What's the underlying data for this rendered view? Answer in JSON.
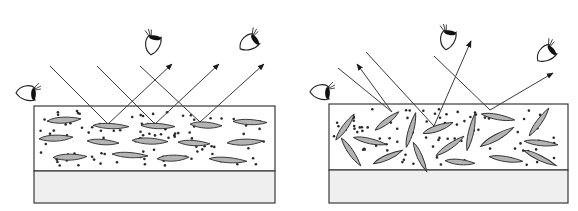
{
  "figure": {
    "colors": {
      "line": "#3a3a3a",
      "flake_fill": "#b4b4b4",
      "substrate_fill": "#efefef",
      "dot": "#2a2a2a",
      "pupil": "#111111"
    },
    "panels": [
      {
        "name": "aligned-flakes",
        "label": "Aligned flakes: specular reflection",
        "box": {
          "x": 34,
          "y": 106,
          "w": 241,
          "coating_h": 65,
          "substrate_h": 32
        },
        "eyes": [
          {
            "cx": 28,
            "cy": 93,
            "rot": 0,
            "icon": "eye-icon"
          },
          {
            "cx": 153,
            "cy": 43,
            "rot": -80,
            "icon": "eye-icon"
          },
          {
            "cx": 250,
            "cy": 42,
            "rot": -35,
            "icon": "eye-icon"
          }
        ],
        "rays": [
          {
            "from": [
              50,
              66
            ],
            "to": [
              108,
              124
            ],
            "out": [
              172,
              64
            ]
          },
          {
            "from": [
              97,
              66
            ],
            "to": [
              155,
              124
            ],
            "out": [
              219,
              64
            ]
          },
          {
            "from": [
              140,
              66
            ],
            "to": [
              200,
              122
            ],
            "out": [
              264,
              64
            ]
          }
        ],
        "flakes": [
          {
            "cx": 64,
            "cy": 120,
            "w": 34,
            "h": 7,
            "rot": -4
          },
          {
            "cx": 111,
            "cy": 126,
            "w": 36,
            "h": 6,
            "rot": 2
          },
          {
            "cx": 158,
            "cy": 126,
            "w": 34,
            "h": 6,
            "rot": 2
          },
          {
            "cx": 206,
            "cy": 125,
            "w": 32,
            "h": 7,
            "rot": 3
          },
          {
            "cx": 250,
            "cy": 122,
            "w": 34,
            "h": 6,
            "rot": 2
          },
          {
            "cx": 56,
            "cy": 138,
            "w": 34,
            "h": 7,
            "rot": -3
          },
          {
            "cx": 103,
            "cy": 142,
            "w": 32,
            "h": 6,
            "rot": 4
          },
          {
            "cx": 150,
            "cy": 141,
            "w": 36,
            "h": 7,
            "rot": 2
          },
          {
            "cx": 194,
            "cy": 143,
            "w": 32,
            "h": 6,
            "rot": 3
          },
          {
            "cx": 245,
            "cy": 142,
            "w": 36,
            "h": 7,
            "rot": -3
          },
          {
            "cx": 70,
            "cy": 157,
            "w": 34,
            "h": 7,
            "rot": -2
          },
          {
            "cx": 130,
            "cy": 155,
            "w": 36,
            "h": 6,
            "rot": 3
          },
          {
            "cx": 173,
            "cy": 158,
            "w": 32,
            "h": 7,
            "rot": -3
          },
          {
            "cx": 228,
            "cy": 160,
            "w": 38,
            "h": 6,
            "rot": 4
          }
        ]
      },
      {
        "name": "random-flakes",
        "label": "Randomly oriented flakes: diffuse reflection",
        "box": {
          "x": 329,
          "y": 104,
          "w": 239,
          "coating_h": 66,
          "substrate_h": 33
        },
        "eyes": [
          {
            "cx": 322,
            "cy": 92,
            "rot": 0,
            "icon": "eye-icon"
          },
          {
            "cx": 448,
            "cy": 38,
            "rot": -80,
            "icon": "eye-icon"
          },
          {
            "cx": 547,
            "cy": 53,
            "rot": -40,
            "icon": "eye-icon"
          }
        ],
        "rays": [
          {
            "from": [
              338,
              68
            ],
            "to": [
              392,
              112
            ],
            "out": [
              357,
              64
            ]
          },
          {
            "from": [
              366,
              52
            ],
            "to": [
              434,
              126
            ],
            "out": [
              471,
              41
            ]
          },
          {
            "from": [
              434,
              56
            ],
            "to": [
              490,
              110
            ],
            "out": [
              553,
              73
            ]
          }
        ],
        "flakes": [
          {
            "cx": 345,
            "cy": 127,
            "w": 32,
            "h": 6,
            "rot": -55
          },
          {
            "cx": 387,
            "cy": 121,
            "w": 30,
            "h": 6,
            "rot": -38
          },
          {
            "cx": 411,
            "cy": 130,
            "w": 36,
            "h": 6,
            "rot": -75
          },
          {
            "cx": 438,
            "cy": 128,
            "w": 32,
            "h": 7,
            "rot": -20
          },
          {
            "cx": 471,
            "cy": 132,
            "w": 38,
            "h": 6,
            "rot": -78
          },
          {
            "cx": 498,
            "cy": 117,
            "w": 34,
            "h": 6,
            "rot": 10
          },
          {
            "cx": 539,
            "cy": 122,
            "w": 34,
            "h": 6,
            "rot": -55
          },
          {
            "cx": 370,
            "cy": 141,
            "w": 34,
            "h": 6,
            "rot": 12
          },
          {
            "cx": 351,
            "cy": 152,
            "w": 34,
            "h": 6,
            "rot": 55
          },
          {
            "cx": 388,
            "cy": 157,
            "w": 32,
            "h": 6,
            "rot": -25
          },
          {
            "cx": 420,
            "cy": 157,
            "w": 32,
            "h": 6,
            "rot": 65
          },
          {
            "cx": 450,
            "cy": 146,
            "w": 34,
            "h": 6,
            "rot": -35
          },
          {
            "cx": 497,
            "cy": 137,
            "w": 38,
            "h": 7,
            "rot": -30
          },
          {
            "cx": 541,
            "cy": 143,
            "w": 34,
            "h": 6,
            "rot": 6
          },
          {
            "cx": 460,
            "cy": 162,
            "w": 30,
            "h": 6,
            "rot": 5
          },
          {
            "cx": 506,
            "cy": 159,
            "w": 34,
            "h": 6,
            "rot": 8
          },
          {
            "cx": 540,
            "cy": 158,
            "w": 36,
            "h": 6,
            "rot": 25
          }
        ]
      }
    ]
  }
}
